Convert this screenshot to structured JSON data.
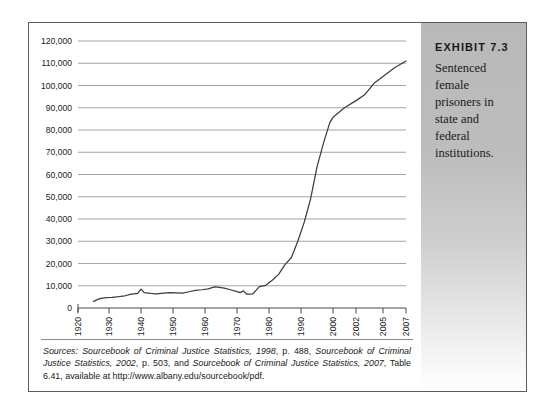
{
  "exhibit": {
    "title": "EXHIBIT 7.3",
    "caption": "Sentenced female prisoners in state and federal institutions."
  },
  "sources": {
    "label": "Sources:",
    "part1_italic": "Sourcebook of Criminal Justice Statistics, 1998",
    "part1_rest": ", p. 488, ",
    "part2_italic": "Sourcebook of Criminal Justice Statistics, 2002",
    "part2_rest": ", p. 503, and ",
    "part3_italic": "Sourcebook of Criminal Justice Statistics, 2007",
    "part3_rest": ", Table 6.41, available at http://www.albany.edu/sourcebook/pdf.",
    "full": "Sources: Sourcebook of Criminal Justice Statistics, 1998, p. 488, Sourcebook of Criminal Justice Statistics, 2002, p. 503, and Sourcebook of Criminal Justice Statistics, 2007, Table 6.41, available at http://www.albany.edu/sourcebook/pdf."
  },
  "chart_data": {
    "type": "line",
    "title": "Sentenced female prisoners in state and federal institutions",
    "xlabel": "",
    "ylabel": "",
    "grid": true,
    "legend": "none",
    "line_color": "#3d3d3d",
    "grid_color": "#9a9a9a",
    "axis_color": "#4a4a4a",
    "xlim": [
      1920,
      2007
    ],
    "ylim": [
      0,
      120000
    ],
    "ytick_labels": [
      "120,000",
      "110,000",
      "100,000",
      "90,000",
      "80,000",
      "70,000",
      "60,000",
      "50,000",
      "40,000",
      "30,000",
      "20,000",
      "10,000",
      "0"
    ],
    "ytick_values": [
      120000,
      110000,
      100000,
      90000,
      80000,
      70000,
      60000,
      50000,
      40000,
      30000,
      20000,
      10000,
      0
    ],
    "xtick_labels": [
      "1920",
      "1930",
      "1940",
      "1950",
      "1960",
      "1970",
      "1980",
      "1990",
      "2000",
      "2002",
      "2005",
      "2007"
    ],
    "xtick_values": [
      1920,
      1930,
      1940,
      1950,
      1960,
      1970,
      1980,
      1990,
      2000,
      2002,
      2005,
      2007
    ],
    "xtick_positions": [
      77,
      108,
      140,
      172,
      204,
      236,
      268,
      300,
      332,
      355,
      382,
      405
    ],
    "x": [
      1925,
      1927,
      1929,
      1931,
      1933,
      1935,
      1937,
      1939,
      1940,
      1941,
      1943,
      1945,
      1947,
      1949,
      1951,
      1953,
      1955,
      1957,
      1959,
      1961,
      1963,
      1964,
      1966,
      1968,
      1970,
      1971,
      1972,
      1973,
      1974,
      1975,
      1977,
      1979,
      1981,
      1983,
      1985,
      1987,
      1989,
      1991,
      1993,
      1995,
      1997,
      1999,
      2000,
      2001,
      2002,
      2003,
      2004,
      2005,
      2006,
      2007
    ],
    "y": [
      3000,
      4200,
      4700,
      4800,
      5100,
      5500,
      6200,
      6600,
      8500,
      6900,
      6600,
      6400,
      6700,
      6900,
      6800,
      6700,
      7300,
      7900,
      8200,
      8600,
      9500,
      9400,
      8900,
      8200,
      7400,
      6900,
      7700,
      6200,
      6200,
      6400,
      9600,
      10200,
      12500,
      15100,
      19500,
      22700,
      30000,
      38500,
      49000,
      63400,
      74000,
      83300,
      85700,
      90000,
      93200,
      96000,
      101000,
      104000,
      108000,
      111000
    ],
    "series_note": "Number of sentenced female prisoners under state and federal jurisdiction, 1925-2007"
  }
}
